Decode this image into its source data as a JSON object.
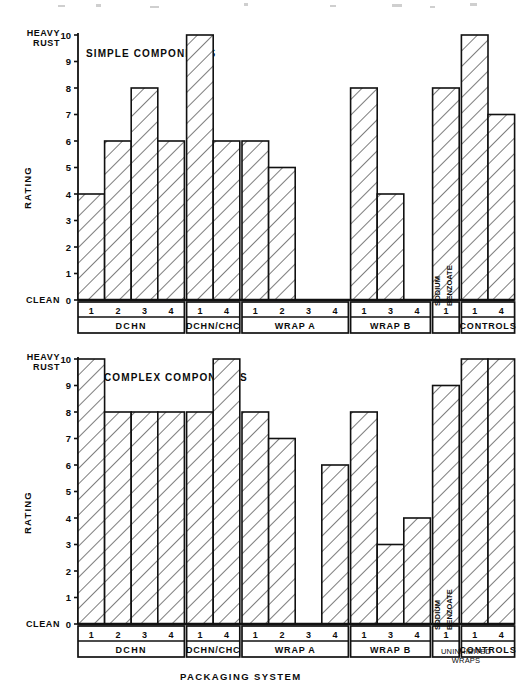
{
  "axis": {
    "top_end_label_line1": "HEAVY",
    "top_end_label_line2": "RUST",
    "bottom_end_label": "CLEAN",
    "y_axis_title": "RATING",
    "y_ticks": [
      "10",
      "9",
      "8",
      "7",
      "6",
      "5",
      "4",
      "3",
      "2",
      "1",
      "0"
    ],
    "x_axis_title": "PACKAGING SYSTEM",
    "footnote": "UNINHIBITED\nWRAPS"
  },
  "groups": [
    {
      "name": "DCHN",
      "ticks": [
        "1",
        "2",
        "3",
        "4"
      ]
    },
    {
      "name": "DCHN/CHC",
      "ticks": [
        "1",
        "4"
      ]
    },
    {
      "name": "WRAP A",
      "ticks": [
        "1",
        "2",
        "3",
        "4"
      ]
    },
    {
      "name": "WRAP B",
      "ticks": [
        "1",
        "3",
        "4"
      ]
    },
    {
      "name": "SODIUM\nBENZOATE",
      "ticks": [
        "1"
      ],
      "vertical": true
    },
    {
      "name": "CONTROLS",
      "ticks": [
        "1",
        "4"
      ]
    }
  ],
  "chart_data": [
    {
      "type": "bar",
      "title": "SIMPLE COMPONENTS",
      "xlabel": "PACKAGING SYSTEM",
      "ylabel": "RATING",
      "ylim": [
        0,
        10
      ],
      "grid": false,
      "y_low_annotation": "CLEAN",
      "y_high_annotation": "HEAVY RUST",
      "categories": [
        "DCHN 1",
        "DCHN 2",
        "DCHN 3",
        "DCHN 4",
        "DCHN/CHC 1",
        "DCHN/CHC 4",
        "WRAP A 1",
        "WRAP A 2",
        "WRAP A 3",
        "WRAP A 4",
        "WRAP B 1",
        "WRAP B 3",
        "WRAP B 4",
        "SODIUM BENZOATE 1",
        "CONTROLS 1",
        "CONTROLS 4"
      ],
      "values": [
        4,
        6,
        8,
        6,
        10,
        6,
        6,
        5,
        0,
        0,
        8,
        4,
        0,
        8,
        10,
        7
      ]
    },
    {
      "type": "bar",
      "title": "COMPLEX COMPONENTS",
      "xlabel": "PACKAGING SYSTEM",
      "ylabel": "RATING",
      "ylim": [
        0,
        10
      ],
      "grid": false,
      "y_low_annotation": "CLEAN",
      "y_high_annotation": "HEAVY RUST",
      "categories": [
        "DCHN 1",
        "DCHN 2",
        "DCHN 3",
        "DCHN 4",
        "DCHN/CHC 1",
        "DCHN/CHC 4",
        "WRAP A 1",
        "WRAP A 2",
        "WRAP A 3",
        "WRAP A 4",
        "WRAP B 1",
        "WRAP B 3",
        "WRAP B 4",
        "SODIUM BENZOATE 1",
        "CONTROLS 1",
        "CONTROLS 4"
      ],
      "values": [
        10,
        8,
        8,
        8,
        8,
        10,
        8,
        7,
        0,
        6,
        8,
        3,
        4,
        9,
        10,
        10
      ]
    }
  ]
}
